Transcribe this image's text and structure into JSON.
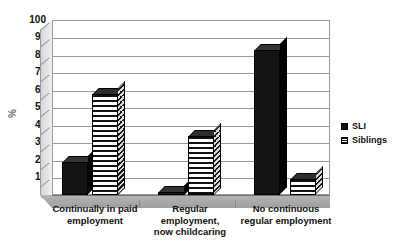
{
  "chart_data": {
    "type": "bar",
    "title": "",
    "subtitle": "",
    "xlabel": "",
    "ylabel": "%",
    "ylim": [
      0,
      100
    ],
    "ytick_step": 10,
    "yticks": [
      100,
      90,
      80,
      70,
      60,
      50,
      40,
      30,
      20,
      10,
      0
    ],
    "grid": true,
    "legend_position": "right",
    "style": "3d-column",
    "categories": [
      "Continually in paid employment",
      "Regular employment, now childcaring",
      "No continuous regular employment"
    ],
    "category_lines": [
      [
        "Continually in paid",
        "employment"
      ],
      [
        "Regular",
        "employment,",
        "now childcaring"
      ],
      [
        "No continuous",
        "regular employment"
      ]
    ],
    "series": [
      {
        "name": "SLI",
        "values": [
          19,
          2,
          83
        ],
        "fill": "solid-black",
        "color": "#141414"
      },
      {
        "name": "Siblings",
        "values": [
          58,
          34,
          9
        ],
        "fill": "horizontal-stripes",
        "color": "#111111"
      }
    ]
  },
  "legend": {
    "items": [
      {
        "label": "SLI",
        "swatch": "solid-black-swatch"
      },
      {
        "label": "Siblings",
        "swatch": "striped-swatch"
      }
    ]
  },
  "axis": {
    "y_label": "%"
  }
}
